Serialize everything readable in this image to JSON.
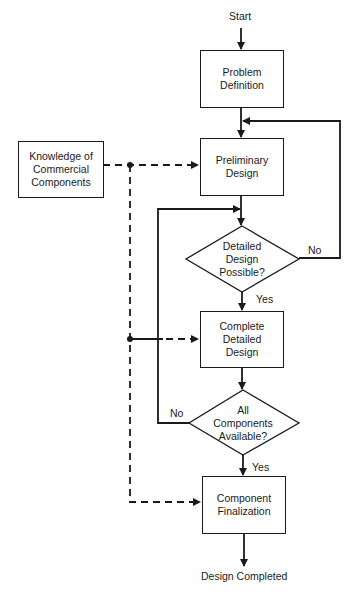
{
  "diagram": {
    "type": "flowchart",
    "start_label": "Start",
    "end_label": "Design Completed",
    "nodes": {
      "problem_definition": {
        "shape": "rectangle",
        "label": "Problem\nDefinition"
      },
      "knowledge": {
        "shape": "rectangle",
        "label": "Knowledge of\nCommercial\nComponents"
      },
      "preliminary_design": {
        "shape": "rectangle",
        "label": "Preliminary\nDesign"
      },
      "decision_detailed": {
        "shape": "diamond",
        "label": "Detailed\nDesign\nPossible?"
      },
      "complete_detailed_design": {
        "shape": "rectangle",
        "label": "Complete\nDetailed\nDesign"
      },
      "decision_components": {
        "shape": "diamond",
        "label": "All\nComponents\nAvailable?"
      },
      "component_finalization": {
        "shape": "rectangle",
        "label": "Component\nFinalization"
      }
    },
    "edge_labels": {
      "detailed_no": "No",
      "detailed_yes": "Yes",
      "components_no": "No",
      "components_yes": "Yes"
    },
    "edges": [
      {
        "from": "Start",
        "to": "problem_definition",
        "style": "solid"
      },
      {
        "from": "problem_definition",
        "to": "preliminary_design",
        "style": "solid"
      },
      {
        "from": "preliminary_design",
        "to": "decision_detailed",
        "style": "solid"
      },
      {
        "from": "decision_detailed",
        "to": "preliminary_design",
        "label": "No",
        "style": "solid"
      },
      {
        "from": "decision_detailed",
        "to": "complete_detailed_design",
        "label": "Yes",
        "style": "solid"
      },
      {
        "from": "complete_detailed_design",
        "to": "decision_components",
        "style": "solid"
      },
      {
        "from": "decision_components",
        "to": "decision_detailed",
        "label": "No",
        "style": "solid"
      },
      {
        "from": "decision_components",
        "to": "component_finalization",
        "label": "Yes",
        "style": "solid"
      },
      {
        "from": "component_finalization",
        "to": "Design Completed",
        "style": "solid"
      },
      {
        "from": "knowledge",
        "to": "preliminary_design",
        "style": "dashed"
      },
      {
        "from": "knowledge",
        "to": "complete_detailed_design",
        "style": "dashed"
      },
      {
        "from": "knowledge",
        "to": "component_finalization",
        "style": "dashed"
      }
    ]
  }
}
